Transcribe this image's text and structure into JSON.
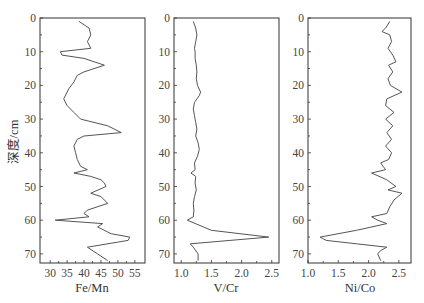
{
  "chart_data": [
    {
      "type": "line",
      "orientation": "vertical-profile",
      "title": "",
      "xlabel": "Fe/Mn",
      "ylabel": "深度/cm",
      "xlim": [
        27,
        58
      ],
      "ylim": [
        72.7,
        0
      ],
      "xticks": [
        30,
        35,
        40,
        45,
        50,
        55
      ],
      "yticks": [
        0,
        10,
        20,
        30,
        40,
        50,
        60,
        70
      ],
      "grid": false,
      "series": [
        {
          "name": "Fe/Mn",
          "depth": [
            1,
            3,
            5,
            7,
            9,
            10,
            11,
            12,
            14,
            16,
            17,
            19,
            21,
            24,
            26,
            28,
            30,
            32,
            34,
            35,
            36,
            38,
            40,
            42,
            44,
            45,
            46,
            47,
            48,
            49,
            50,
            52,
            53,
            55,
            57,
            58,
            59,
            60,
            61,
            62,
            64,
            65,
            66,
            68,
            70,
            72
          ],
          "values": [
            38.5,
            41.5,
            42,
            41,
            42,
            33,
            33.5,
            40,
            46,
            40,
            38,
            37,
            35.5,
            34,
            35,
            37,
            39,
            47,
            51,
            40,
            38,
            37,
            37.5,
            38,
            39,
            41,
            37,
            42,
            45,
            46,
            46.5,
            42,
            45,
            47,
            41,
            40,
            41.5,
            31.5,
            45.5,
            44,
            48,
            53.5,
            53,
            41,
            44,
            47
          ]
        }
      ]
    },
    {
      "type": "line",
      "orientation": "vertical-profile",
      "title": "",
      "xlabel": "V/Cr",
      "ylabel": "",
      "xlim": [
        0.88,
        2.62
      ],
      "ylim": [
        72.7,
        0
      ],
      "xticks": [
        "1.0",
        "1.5",
        "2.0",
        "2.5"
      ],
      "yticks": [
        0,
        10,
        20,
        30,
        40,
        50,
        60,
        70
      ],
      "grid": false,
      "series": [
        {
          "name": "V/Cr",
          "depth": [
            1,
            3,
            5,
            7,
            9,
            10,
            12,
            14,
            16,
            18,
            20,
            22,
            23,
            25,
            27,
            29,
            31,
            33,
            35,
            37,
            39,
            41,
            43,
            45,
            46,
            47,
            49,
            51,
            53,
            55,
            57,
            59,
            60,
            63,
            65,
            67,
            68,
            70,
            72
          ],
          "values": [
            1.2,
            1.24,
            1.26,
            1.24,
            1.22,
            1.23,
            1.23,
            1.25,
            1.26,
            1.25,
            1.27,
            1.32,
            1.3,
            1.22,
            1.2,
            1.22,
            1.24,
            1.26,
            1.24,
            1.28,
            1.3,
            1.27,
            1.22,
            1.23,
            1.16,
            1.24,
            1.23,
            1.25,
            1.22,
            1.2,
            1.21,
            1.2,
            1.1,
            1.5,
            2.45,
            1.15,
            1.2,
            1.28,
            1.28
          ]
        }
      ]
    },
    {
      "type": "line",
      "orientation": "vertical-profile",
      "title": "",
      "xlabel": "Ni/Co",
      "ylabel": "",
      "xlim": [
        1.0,
        2.7
      ],
      "ylim": [
        72.7,
        0
      ],
      "xticks": [
        "1.0",
        "1.5",
        "2.0",
        "2.5"
      ],
      "yticks": [
        0,
        10,
        20,
        30,
        40,
        50,
        60,
        70
      ],
      "grid": false,
      "series": [
        {
          "name": "Ni/Co",
          "depth": [
            1,
            3,
            4,
            5,
            7,
            9,
            11,
            13,
            14,
            16,
            18,
            20,
            22,
            24,
            26,
            28,
            30,
            32,
            34,
            36,
            38,
            40,
            42,
            43,
            44,
            45,
            46,
            48,
            50,
            51,
            52,
            54,
            56,
            58,
            59,
            60,
            61,
            63,
            65,
            66,
            67,
            68,
            69,
            70,
            72
          ],
          "values": [
            2.35,
            2.28,
            2.22,
            2.35,
            2.38,
            2.32,
            2.4,
            2.45,
            2.33,
            2.4,
            2.32,
            2.36,
            2.55,
            2.3,
            2.28,
            2.42,
            2.28,
            2.4,
            2.3,
            2.38,
            2.28,
            2.38,
            2.33,
            2.2,
            2.24,
            2.28,
            2.05,
            2.3,
            2.45,
            2.32,
            2.55,
            2.42,
            2.35,
            2.3,
            2.05,
            2.15,
            2.3,
            1.8,
            1.2,
            1.3,
            1.8,
            2.3,
            2.2,
            2.15,
            2.2
          ]
        }
      ]
    }
  ],
  "panels": [
    {
      "xlabel": "Fe/Mn"
    },
    {
      "xlabel": "V/Cr"
    },
    {
      "xlabel": "Ni/Co"
    }
  ],
  "ylabel": "深度/cm"
}
